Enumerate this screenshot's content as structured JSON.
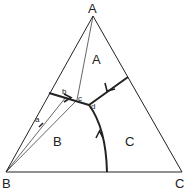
{
  "diagram": {
    "type": "ternary phase diagram",
    "vertices": {
      "A": "A",
      "B": "B",
      "C": "C"
    },
    "regions": {
      "A": "A",
      "B": "B",
      "C": "C"
    },
    "points": {
      "a": "a",
      "b": "b",
      "c": "c",
      "d": "d"
    },
    "colors": {
      "line": "#222222",
      "background": "#ffffff"
    }
  }
}
